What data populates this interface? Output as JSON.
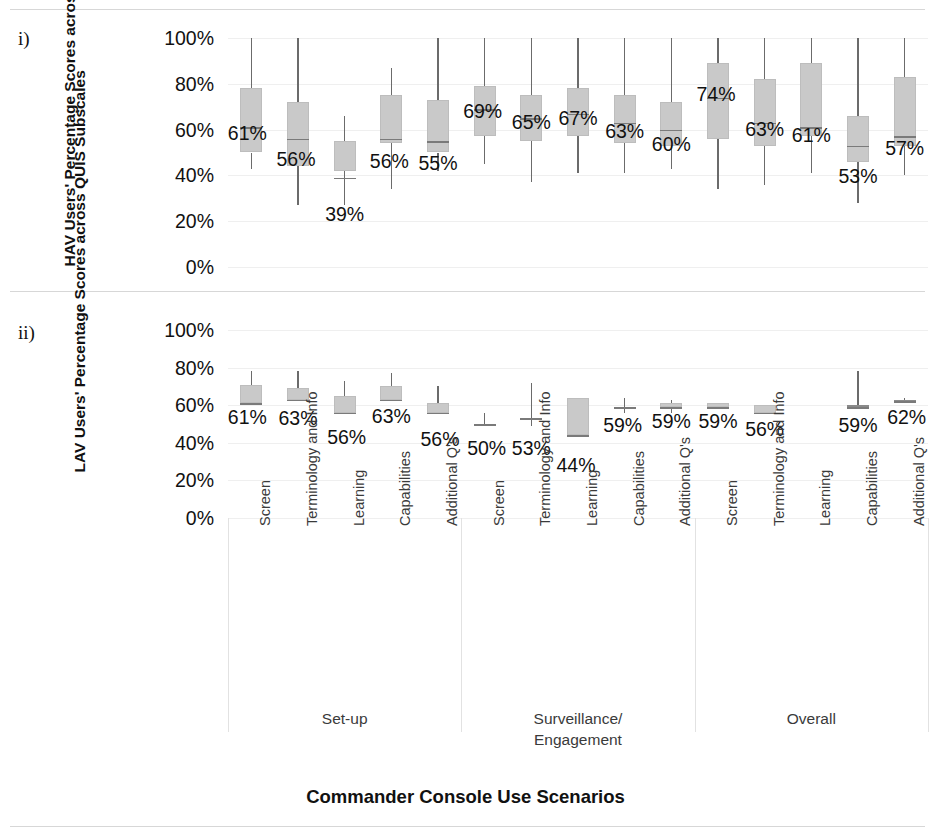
{
  "figure": {
    "panels": [
      {
        "letter": "i)",
        "ylabel": "HAV Users' Percentage Scores across QUIS Subscales"
      },
      {
        "letter": "ii)",
        "ylabel": "LAV Users' Percentage Scores across QUIS Subscales"
      }
    ],
    "xtitle": "Commander Console Use Scenarios",
    "group_labels": [
      "Set-up",
      "Surveillance/\nEngagement",
      "Overall"
    ],
    "group_label_lines": [
      [
        "Set-up"
      ],
      [
        "Surveillance/",
        "Engagement"
      ],
      [
        "Overall"
      ]
    ],
    "yticks": [
      "0%",
      "20%",
      "40%",
      "60%",
      "80%",
      "100%"
    ],
    "categories": [
      "Screen",
      "Terminology and Info",
      "Learning",
      "Capabilities",
      "Additional Q's",
      "Screen",
      "Terminology and Info",
      "Learning",
      "Capabilities",
      "Additional Q's",
      "Screen",
      "Terminology and Info",
      "Learning",
      "Capabilities",
      "Additional Q's"
    ],
    "colors": {
      "box_fill": "#c9c9c9",
      "box_stroke": "#bdbdbd",
      "whisker": "#6b6b6b",
      "gridline": "#efefef",
      "text": "#111111"
    }
  },
  "chart_data": [
    {
      "type": "box",
      "id": "panel-i",
      "title": "i) HAV Users' Percentage Scores across QUIS Subscales",
      "xlabel": "Commander Console Use Scenarios",
      "ylabel": "HAV Users' Percentage Scores across QUIS Subscales",
      "ylim": [
        0,
        100
      ],
      "yticks": [
        0,
        20,
        40,
        60,
        80,
        100
      ],
      "grid": true,
      "legend": "none",
      "groups": [
        "Set-up",
        "Surveillance/Engagement",
        "Overall"
      ],
      "categories": [
        "Screen",
        "Terminology and Info",
        "Learning",
        "Capabilities",
        "Additional Q's",
        "Screen",
        "Terminology and Info",
        "Learning",
        "Capabilities",
        "Additional Q's",
        "Screen",
        "Terminology and Info",
        "Learning",
        "Capabilities",
        "Additional Q's"
      ],
      "boxes": [
        {
          "category": "Screen",
          "group": "Set-up",
          "whisker_low": 43,
          "q1": 50,
          "median": 61,
          "q3": 78,
          "whisker_high": 100,
          "label": "61%"
        },
        {
          "category": "Terminology and Info",
          "group": "Set-up",
          "whisker_low": 27,
          "q1": 44,
          "median": 56,
          "q3": 72,
          "whisker_high": 100,
          "label": "56%"
        },
        {
          "category": "Learning",
          "group": "Set-up",
          "whisker_low": 27,
          "q1": 42,
          "median": 39,
          "q3": 55,
          "whisker_high": 66,
          "label": "39%"
        },
        {
          "category": "Capabilities",
          "group": "Set-up",
          "whisker_low": 34,
          "q1": 54,
          "median": 56,
          "q3": 75,
          "whisker_high": 87,
          "label": "56%"
        },
        {
          "category": "Additional Q's",
          "group": "Set-up",
          "whisker_low": 42,
          "q1": 50,
          "median": 55,
          "q3": 73,
          "whisker_high": 100,
          "label": "55%"
        },
        {
          "category": "Screen",
          "group": "Surveillance/Engagement",
          "whisker_low": 45,
          "q1": 57,
          "median": 69,
          "q3": 79,
          "whisker_high": 100,
          "label": "69%"
        },
        {
          "category": "Terminology and Info",
          "group": "Surveillance/Engagement",
          "whisker_low": 37,
          "q1": 55,
          "median": 65,
          "q3": 75,
          "whisker_high": 100,
          "label": "65%"
        },
        {
          "category": "Learning",
          "group": "Surveillance/Engagement",
          "whisker_low": 41,
          "q1": 57,
          "median": 67,
          "q3": 78,
          "whisker_high": 100,
          "label": "67%"
        },
        {
          "category": "Capabilities",
          "group": "Surveillance/Engagement",
          "whisker_low": 41,
          "q1": 54,
          "median": 63,
          "q3": 75,
          "whisker_high": 100,
          "label": "63%"
        },
        {
          "category": "Additional Q's",
          "group": "Surveillance/Engagement",
          "whisker_low": 43,
          "q1": 53,
          "median": 60,
          "q3": 72,
          "whisker_high": 100,
          "label": "60%"
        },
        {
          "category": "Screen",
          "group": "Overall",
          "whisker_low": 34,
          "q1": 56,
          "median": 74,
          "q3": 89,
          "whisker_high": 100,
          "label": "74%"
        },
        {
          "category": "Terminology and Info",
          "group": "Overall",
          "whisker_low": 36,
          "q1": 53,
          "median": 63,
          "q3": 82,
          "whisker_high": 100,
          "label": "63%"
        },
        {
          "category": "Learning",
          "group": "Overall",
          "whisker_low": 41,
          "q1": 57,
          "median": 61,
          "q3": 89,
          "whisker_high": 100,
          "label": "61%"
        },
        {
          "category": "Capabilities",
          "group": "Overall",
          "whisker_low": 28,
          "q1": 46,
          "median": 53,
          "q3": 66,
          "whisker_high": 100,
          "label": "53%"
        },
        {
          "category": "Additional Q's",
          "group": "Overall",
          "whisker_low": 40,
          "q1": 53,
          "median": 57,
          "q3": 83,
          "whisker_high": 100,
          "label": "57%"
        }
      ]
    },
    {
      "type": "box",
      "id": "panel-ii",
      "title": "ii) LAV Users' Percentage Scores across QUIS Subscales",
      "xlabel": "Commander Console Use Scenarios",
      "ylabel": "LAV Users' Percentage Scores across QUIS Subscales",
      "ylim": [
        0,
        100
      ],
      "yticks": [
        0,
        20,
        40,
        60,
        80,
        100
      ],
      "grid": true,
      "legend": "none",
      "groups": [
        "Set-up",
        "Surveillance/Engagement",
        "Overall"
      ],
      "categories": [
        "Screen",
        "Terminology and Info",
        "Learning",
        "Capabilities",
        "Additional Q's",
        "Screen",
        "Terminology and Info",
        "Learning",
        "Capabilities",
        "Additional Q's",
        "Screen",
        "Terminology and Info",
        "Learning",
        "Capabilities",
        "Additional Q's"
      ],
      "boxes": [
        {
          "category": "Screen",
          "group": "Set-up",
          "whisker_low": 61,
          "q1": 61,
          "median": 61,
          "q3": 71,
          "whisker_high": 78,
          "label": "61%"
        },
        {
          "category": "Terminology and Info",
          "group": "Set-up",
          "whisker_low": 63,
          "q1": 63,
          "median": 63,
          "q3": 69,
          "whisker_high": 78,
          "label": "63%"
        },
        {
          "category": "Learning",
          "group": "Set-up",
          "whisker_low": 56,
          "q1": 56,
          "median": 56,
          "q3": 65,
          "whisker_high": 73,
          "label": "56%"
        },
        {
          "category": "Capabilities",
          "group": "Set-up",
          "whisker_low": 63,
          "q1": 63,
          "median": 63,
          "q3": 70,
          "whisker_high": 77,
          "label": "63%"
        },
        {
          "category": "Additional Q's",
          "group": "Set-up",
          "whisker_low": 56,
          "q1": 56,
          "median": 56,
          "q3": 61,
          "whisker_high": 70,
          "label": "56%"
        },
        {
          "category": "Screen",
          "group": "Surveillance/Engagement",
          "whisker_low": 50,
          "q1": 50,
          "median": 50,
          "q3": 50,
          "whisker_high": 56,
          "label": "50%"
        },
        {
          "category": "Terminology and Info",
          "group": "Surveillance/Engagement",
          "whisker_low": 49,
          "q1": 53,
          "median": 53,
          "q3": 53,
          "whisker_high": 72,
          "label": "53%"
        },
        {
          "category": "Learning",
          "group": "Surveillance/Engagement",
          "whisker_low": 44,
          "q1": 44,
          "median": 44,
          "q3": 64,
          "whisker_high": 64,
          "label": "44%"
        },
        {
          "category": "Capabilities",
          "group": "Surveillance/Engagement",
          "whisker_low": 56,
          "q1": 59,
          "median": 59,
          "q3": 59,
          "whisker_high": 64,
          "label": "59%"
        },
        {
          "category": "Additional Q's",
          "group": "Surveillance/Engagement",
          "whisker_low": 56,
          "q1": 59,
          "median": 59,
          "q3": 61,
          "whisker_high": 63,
          "label": "59%"
        },
        {
          "category": "Screen",
          "group": "Overall",
          "whisker_low": 59,
          "q1": 59,
          "median": 59,
          "q3": 61,
          "whisker_high": 61,
          "label": "59%"
        },
        {
          "category": "Terminology and Info",
          "group": "Overall",
          "whisker_low": 56,
          "q1": 56,
          "median": 56,
          "q3": 60,
          "whisker_high": 60,
          "label": "56%"
        },
        {
          "category": "Capabilities",
          "group": "Overall",
          "whisker_low": 59,
          "q1": 59,
          "median": 59,
          "q3": 60,
          "whisker_high": 78,
          "label": "59%"
        },
        {
          "category": "Additional Q's",
          "group": "Overall",
          "whisker_low": 62,
          "q1": 62,
          "median": 62,
          "q3": 63,
          "whisker_high": 64,
          "label": "62%"
        }
      ],
      "note": "The 'Learning' box of the Overall group has no plotted data in panel ii."
    }
  ]
}
